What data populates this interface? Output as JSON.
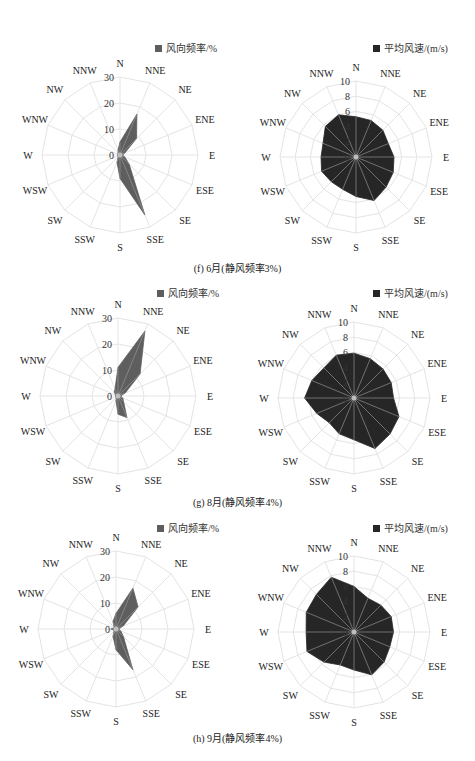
{
  "directions": [
    "N",
    "NNE",
    "NE",
    "ENE",
    "E",
    "ESE",
    "SE",
    "SSE",
    "S",
    "SSW",
    "SW",
    "WSW",
    "W",
    "WNW",
    "NW",
    "NNW"
  ],
  "colors": {
    "freq_fill": "#5e5e5e",
    "speed_fill": "#262626",
    "grid": "#e4e4e4",
    "spoke_inner": "#9a9a9a"
  },
  "rows": [
    {
      "caption": "(f) 6月(静风频率3%)"
    },
    {
      "caption": "(g) 8月(静风频率4%)"
    },
    {
      "caption": "(h) 9月(静风频率4%)"
    }
  ],
  "chart_data": [
    {
      "type": "radar",
      "title": "(f) 6月(静风频率3%)",
      "legend": "风向频率/%",
      "categories": [
        "N",
        "NNE",
        "NE",
        "ENE",
        "E",
        "ESE",
        "SE",
        "SSE",
        "S",
        "SSW",
        "SW",
        "WSW",
        "W",
        "WNW",
        "NW",
        "NNW"
      ],
      "rlim": [
        0,
        30
      ],
      "rticks": [
        0,
        10,
        20,
        30
      ],
      "values": [
        5,
        17,
        9,
        2,
        1,
        2,
        5,
        25,
        9,
        3,
        1,
        1,
        1,
        1,
        1,
        2
      ]
    },
    {
      "type": "radar",
      "title": "(f) 6月(静风频率3%)",
      "legend": "平均风速/(m/s)",
      "categories": [
        "N",
        "NNE",
        "NE",
        "ENE",
        "E",
        "ESE",
        "SE",
        "SSE",
        "S",
        "SSW",
        "SW",
        "WSW",
        "W",
        "WNW",
        "NW",
        "NNW"
      ],
      "rlim": [
        0,
        10
      ],
      "rticks": [
        0,
        2,
        4,
        6,
        8,
        10
      ],
      "values": [
        5.3,
        5.2,
        5.0,
        4.6,
        5.0,
        5.3,
        5.6,
        6.2,
        5.2,
        4.6,
        4.6,
        4.9,
        4.6,
        4.7,
        5.7,
        6.0
      ]
    },
    {
      "type": "radar",
      "title": "(g) 8月(静风频率4%)",
      "legend": "风向频率/%",
      "categories": [
        "N",
        "NNE",
        "NE",
        "ENE",
        "E",
        "ESE",
        "SE",
        "SSE",
        "S",
        "SSW",
        "SW",
        "WSW",
        "W",
        "WNW",
        "NW",
        "NNW"
      ],
      "rlim": [
        0,
        30
      ],
      "rticks": [
        0,
        10,
        20,
        30
      ],
      "values": [
        11,
        27,
        12,
        3,
        1,
        2,
        3,
        9,
        7,
        2,
        1,
        1,
        1,
        1,
        2,
        3
      ]
    },
    {
      "type": "radar",
      "title": "(g) 8月(静风频率4%)",
      "legend": "平均风速/(m/s)",
      "categories": [
        "N",
        "NNE",
        "NE",
        "ENE",
        "E",
        "ESE",
        "SE",
        "SSE",
        "S",
        "SSW",
        "SW",
        "WSW",
        "W",
        "WNW",
        "NW",
        "NNW"
      ],
      "rlim": [
        0,
        10
      ],
      "rticks": [
        0,
        2,
        4,
        6,
        8,
        10
      ],
      "values": [
        5.9,
        5.6,
        5.4,
        5.3,
        5.2,
        6.4,
        6.7,
        7.2,
        5.5,
        5.1,
        4.6,
        5.3,
        6.5,
        6.0,
        5.6,
        6.1
      ]
    },
    {
      "type": "radar",
      "title": "(h) 9月(静风频率4%)",
      "legend": "风向频率/%",
      "categories": [
        "N",
        "NNE",
        "NE",
        "ENE",
        "E",
        "ESE",
        "SE",
        "SSE",
        "S",
        "SSW",
        "SW",
        "WSW",
        "W",
        "WNW",
        "NW",
        "NNW"
      ],
      "rlim": [
        0,
        30
      ],
      "rticks": [
        0,
        10,
        20,
        30
      ],
      "values": [
        6,
        17,
        12,
        3,
        1,
        2,
        4,
        17,
        8,
        3,
        1,
        1,
        2,
        1,
        1,
        3
      ]
    },
    {
      "type": "radar",
      "title": "(h) 9月(静风频率4%)",
      "legend": "平均风速/(m/s)",
      "categories": [
        "N",
        "NNE",
        "NE",
        "ENE",
        "E",
        "ESE",
        "SE",
        "SSE",
        "S",
        "SSW",
        "SW",
        "WSW",
        "W",
        "WNW",
        "NW",
        "NNW"
      ],
      "rlim": [
        0,
        10
      ],
      "rticks": [
        0,
        2,
        4,
        6,
        8,
        10
      ],
      "values": [
        6.0,
        4.8,
        5.0,
        5.3,
        5.2,
        5.1,
        5.6,
        6.1,
        5.0,
        4.7,
        5.6,
        6.7,
        6.3,
        6.8,
        7.0,
        7.8
      ]
    }
  ]
}
